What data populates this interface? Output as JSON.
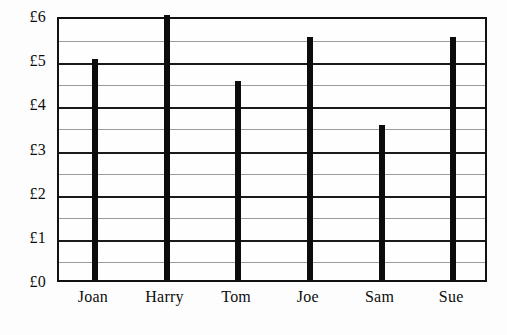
{
  "chart_data": {
    "type": "bar",
    "title": "",
    "subtitle": "",
    "xlabel": "",
    "ylabel": "",
    "categories": [
      "Joan",
      "Harry",
      "Tom",
      "Joe",
      "Sam",
      "Sue"
    ],
    "values": [
      5,
      6,
      4.5,
      5.5,
      3.5,
      5.5
    ],
    "value_labels": [
      "£5",
      "£6",
      "£4.50",
      "£5.50",
      "£3.50",
      "£5.50"
    ],
    "ylim": [
      0,
      6
    ],
    "xlim": [
      0,
      6
    ],
    "y_major_ticks": [
      0,
      1,
      2,
      3,
      4,
      5,
      6
    ],
    "y_major_tick_labels": [
      "£0",
      "£1",
      "£2",
      "£3",
      "£4",
      "£5",
      "£6"
    ],
    "y_minor_ticks": [
      0.5,
      1.5,
      2.5,
      3.5,
      4.5,
      5.5
    ],
    "currency_symbol": "£",
    "grid": true,
    "grid_axis": "y",
    "legend": false,
    "legend_position": "none",
    "annotations": [],
    "colors": {
      "bar": "#0c0c0c",
      "frame": "#111111",
      "grid_major": "#1a1a1a",
      "grid_minor": "#9b9b9b",
      "background": "#fdfdfd",
      "plot_background": "#fefefe",
      "text": "#0d0d0d"
    }
  }
}
